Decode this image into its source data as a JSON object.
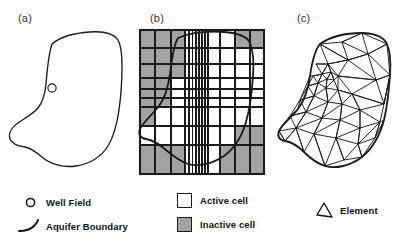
{
  "figure": {
    "panels": [
      {
        "id": "a",
        "label": "(a)",
        "name": "aquifer-map",
        "description": "Aquifer boundary with well field"
      },
      {
        "id": "b",
        "label": "(b)",
        "name": "finite-difference-grid",
        "description": "Finite-difference grid with active and inactive cells"
      },
      {
        "id": "c",
        "label": "(c)",
        "name": "finite-element-mesh",
        "description": "Finite-element triangular mesh"
      }
    ]
  },
  "legends": {
    "left": {
      "name": "map-legend",
      "items": [
        {
          "label": "Well Field",
          "marker": "circle-icon"
        },
        {
          "label": "Aquifer Boundary",
          "marker": "curve-icon"
        }
      ]
    },
    "middle": {
      "name": "grid-legend",
      "items": [
        {
          "label": "Active cell",
          "marker": "white-square-icon",
          "color": "#ffffff"
        },
        {
          "label": "Inactive cell",
          "marker": "gray-square-icon",
          "color": "#a3a3a3"
        }
      ]
    },
    "right": {
      "name": "mesh-legend",
      "items": [
        {
          "label": "Element",
          "marker": "triangle-icon"
        }
      ]
    }
  },
  "colors": {
    "line": "#1a1a1a",
    "inactive_cell": "#a3a3a3",
    "active_cell": "#ffffff",
    "background": "#ffffff"
  }
}
